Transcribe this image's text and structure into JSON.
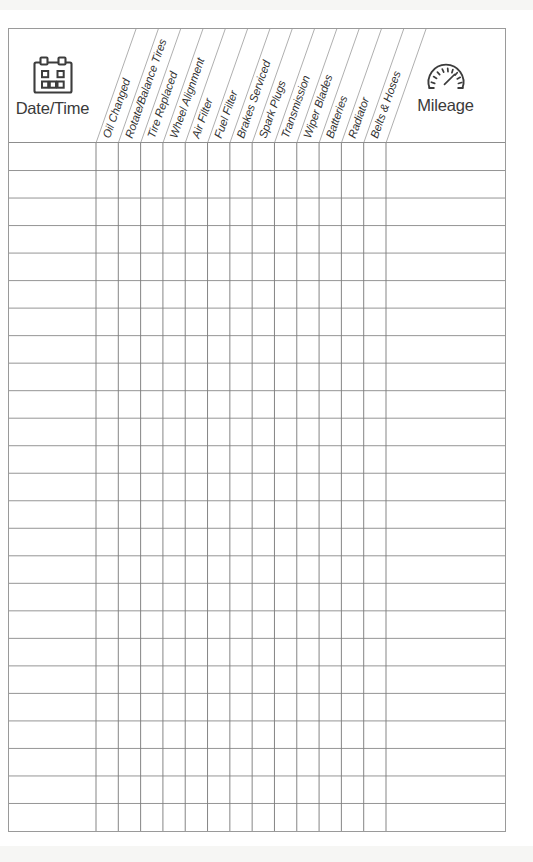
{
  "document": {
    "title": "Vehicle Maintenance Log",
    "type": "printable-form"
  },
  "table": {
    "first_column": {
      "label": "Date/Time",
      "icon": "calendar-icon"
    },
    "last_column": {
      "label": "Mileage",
      "icon": "gauge-icon"
    },
    "service_columns": [
      {
        "label": "Oil Changed"
      },
      {
        "label": "Rotate/Balance Tires"
      },
      {
        "label": "Tire Replaced"
      },
      {
        "label": "Wheel Alignment"
      },
      {
        "label": "Air Filter"
      },
      {
        "label": "Fuel Filter"
      },
      {
        "label": "Brakes Serviced"
      },
      {
        "label": "Spark Plugs"
      },
      {
        "label": "Transmission"
      },
      {
        "label": "Wiper Blades"
      },
      {
        "label": "Batteries"
      },
      {
        "label": "Radiator"
      },
      {
        "label": "Belts & Hoses"
      }
    ],
    "row_count": 25,
    "rows": [
      {
        "datetime": "",
        "mileage": "",
        "checks": [
          "",
          "",
          "",
          "",
          "",
          "",
          "",
          "",
          "",
          "",
          "",
          "",
          ""
        ]
      },
      {
        "datetime": "",
        "mileage": "",
        "checks": [
          "",
          "",
          "",
          "",
          "",
          "",
          "",
          "",
          "",
          "",
          "",
          "",
          ""
        ]
      },
      {
        "datetime": "",
        "mileage": "",
        "checks": [
          "",
          "",
          "",
          "",
          "",
          "",
          "",
          "",
          "",
          "",
          "",
          "",
          ""
        ]
      },
      {
        "datetime": "",
        "mileage": "",
        "checks": [
          "",
          "",
          "",
          "",
          "",
          "",
          "",
          "",
          "",
          "",
          "",
          "",
          ""
        ]
      },
      {
        "datetime": "",
        "mileage": "",
        "checks": [
          "",
          "",
          "",
          "",
          "",
          "",
          "",
          "",
          "",
          "",
          "",
          "",
          ""
        ]
      },
      {
        "datetime": "",
        "mileage": "",
        "checks": [
          "",
          "",
          "",
          "",
          "",
          "",
          "",
          "",
          "",
          "",
          "",
          "",
          ""
        ]
      },
      {
        "datetime": "",
        "mileage": "",
        "checks": [
          "",
          "",
          "",
          "",
          "",
          "",
          "",
          "",
          "",
          "",
          "",
          "",
          ""
        ]
      },
      {
        "datetime": "",
        "mileage": "",
        "checks": [
          "",
          "",
          "",
          "",
          "",
          "",
          "",
          "",
          "",
          "",
          "",
          "",
          ""
        ]
      },
      {
        "datetime": "",
        "mileage": "",
        "checks": [
          "",
          "",
          "",
          "",
          "",
          "",
          "",
          "",
          "",
          "",
          "",
          "",
          ""
        ]
      },
      {
        "datetime": "",
        "mileage": "",
        "checks": [
          "",
          "",
          "",
          "",
          "",
          "",
          "",
          "",
          "",
          "",
          "",
          "",
          ""
        ]
      },
      {
        "datetime": "",
        "mileage": "",
        "checks": [
          "",
          "",
          "",
          "",
          "",
          "",
          "",
          "",
          "",
          "",
          "",
          "",
          ""
        ]
      },
      {
        "datetime": "",
        "mileage": "",
        "checks": [
          "",
          "",
          "",
          "",
          "",
          "",
          "",
          "",
          "",
          "",
          "",
          "",
          ""
        ]
      },
      {
        "datetime": "",
        "mileage": "",
        "checks": [
          "",
          "",
          "",
          "",
          "",
          "",
          "",
          "",
          "",
          "",
          "",
          "",
          ""
        ]
      },
      {
        "datetime": "",
        "mileage": "",
        "checks": [
          "",
          "",
          "",
          "",
          "",
          "",
          "",
          "",
          "",
          "",
          "",
          "",
          ""
        ]
      },
      {
        "datetime": "",
        "mileage": "",
        "checks": [
          "",
          "",
          "",
          "",
          "",
          "",
          "",
          "",
          "",
          "",
          "",
          "",
          ""
        ]
      },
      {
        "datetime": "",
        "mileage": "",
        "checks": [
          "",
          "",
          "",
          "",
          "",
          "",
          "",
          "",
          "",
          "",
          "",
          "",
          ""
        ]
      },
      {
        "datetime": "",
        "mileage": "",
        "checks": [
          "",
          "",
          "",
          "",
          "",
          "",
          "",
          "",
          "",
          "",
          "",
          "",
          ""
        ]
      },
      {
        "datetime": "",
        "mileage": "",
        "checks": [
          "",
          "",
          "",
          "",
          "",
          "",
          "",
          "",
          "",
          "",
          "",
          "",
          ""
        ]
      },
      {
        "datetime": "",
        "mileage": "",
        "checks": [
          "",
          "",
          "",
          "",
          "",
          "",
          "",
          "",
          "",
          "",
          "",
          "",
          ""
        ]
      },
      {
        "datetime": "",
        "mileage": "",
        "checks": [
          "",
          "",
          "",
          "",
          "",
          "",
          "",
          "",
          "",
          "",
          "",
          "",
          ""
        ]
      },
      {
        "datetime": "",
        "mileage": "",
        "checks": [
          "",
          "",
          "",
          "",
          "",
          "",
          "",
          "",
          "",
          "",
          "",
          "",
          ""
        ]
      },
      {
        "datetime": "",
        "mileage": "",
        "checks": [
          "",
          "",
          "",
          "",
          "",
          "",
          "",
          "",
          "",
          "",
          "",
          "",
          ""
        ]
      },
      {
        "datetime": "",
        "mileage": "",
        "checks": [
          "",
          "",
          "",
          "",
          "",
          "",
          "",
          "",
          "",
          "",
          "",
          "",
          ""
        ]
      },
      {
        "datetime": "",
        "mileage": "",
        "checks": [
          "",
          "",
          "",
          "",
          "",
          "",
          "",
          "",
          "",
          "",
          "",
          "",
          ""
        ]
      },
      {
        "datetime": "",
        "mileage": "",
        "checks": [
          "",
          "",
          "",
          "",
          "",
          "",
          "",
          "",
          "",
          "",
          "",
          "",
          ""
        ]
      }
    ]
  },
  "colors": {
    "paper": "#ffffff",
    "rule": "#8f8f8f",
    "frame": "#9a9a9a",
    "ink": "#333333"
  }
}
